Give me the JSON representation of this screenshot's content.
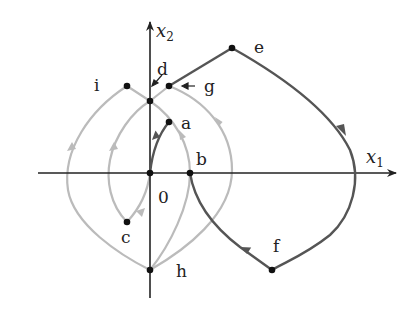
{
  "diagram": {
    "type": "phase-portrait",
    "axes": {
      "x_label": "x",
      "x_sub": "1",
      "y_label": "x",
      "y_sub": "2",
      "origin_label": "0"
    },
    "points": [
      {
        "id": "a",
        "label": "a"
      },
      {
        "id": "b",
        "label": "b"
      },
      {
        "id": "c",
        "label": "c"
      },
      {
        "id": "d",
        "label": "d"
      },
      {
        "id": "e",
        "label": "e"
      },
      {
        "id": "f",
        "label": "f"
      },
      {
        "id": "g",
        "label": "g"
      },
      {
        "id": "h",
        "label": "h"
      },
      {
        "id": "i",
        "label": "i"
      }
    ],
    "colors": {
      "axis": "#222222",
      "dark_trajectory": "#555555",
      "light_trajectory": "#bbbbbb",
      "point": "#111111"
    }
  }
}
